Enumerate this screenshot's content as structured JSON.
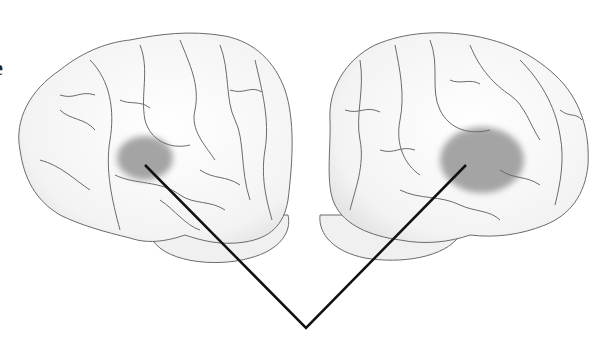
{
  "figure": {
    "edge_label_fragment": "e",
    "left_brain": {
      "view": "left-hemisphere-lateral",
      "highlight": "inferior-frontal-region"
    },
    "right_brain": {
      "view": "right-hemisphere-lateral",
      "highlight": "inferior-frontal-region"
    },
    "pointer": {
      "shape": "V",
      "left_start": [
        145,
        165
      ],
      "right_start": [
        466,
        165
      ],
      "vertex": [
        306,
        328
      ]
    },
    "colors": {
      "outline": "#6b6b6b",
      "fill": "#f4f4f4",
      "shade": "#e2e2e2",
      "highlight": "#8f8f8f",
      "pointer": "#111111"
    }
  }
}
